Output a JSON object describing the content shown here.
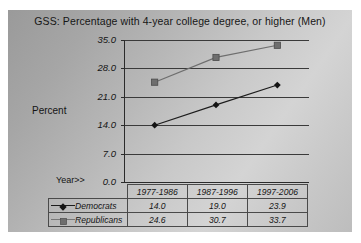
{
  "chart_data": {
    "type": "line",
    "title": "GSS:  Percentage with 4-year college degree, or higher (Men)",
    "xlabel": "Year>>",
    "ylabel": "Percent",
    "categories": [
      "1977-1986",
      "1987-1996",
      "1997-2006"
    ],
    "series": [
      {
        "name": "Democrats",
        "values": [
          14.0,
          19.0,
          23.9
        ],
        "marker": "diamond",
        "color": "#1c1c1c"
      },
      {
        "name": "Republicans",
        "values": [
          24.6,
          30.7,
          33.7
        ],
        "marker": "square",
        "color": "#6e6e6e"
      }
    ],
    "yticks": [
      "0.0",
      "7.0",
      "14.0",
      "21.0",
      "28.0",
      "35.0"
    ],
    "ytick_values": [
      0.0,
      7.0,
      14.0,
      21.0,
      28.0,
      35.0
    ],
    "ylim": [
      0.0,
      35.0
    ],
    "grid": true,
    "legend_position": "bottom-table",
    "plot_background": "gradient-gray"
  },
  "table": {
    "header_cells": [
      "1977-1986",
      "1987-1996",
      "1997-2006"
    ],
    "rows": [
      {
        "label": "Democrats",
        "cells": [
          "14.0",
          "19.0",
          "23.9"
        ]
      },
      {
        "label": "Republicans",
        "cells": [
          "24.6",
          "30.7",
          "33.7"
        ]
      }
    ]
  },
  "labels": {
    "percent": "Percent",
    "year": "Year>>"
  }
}
